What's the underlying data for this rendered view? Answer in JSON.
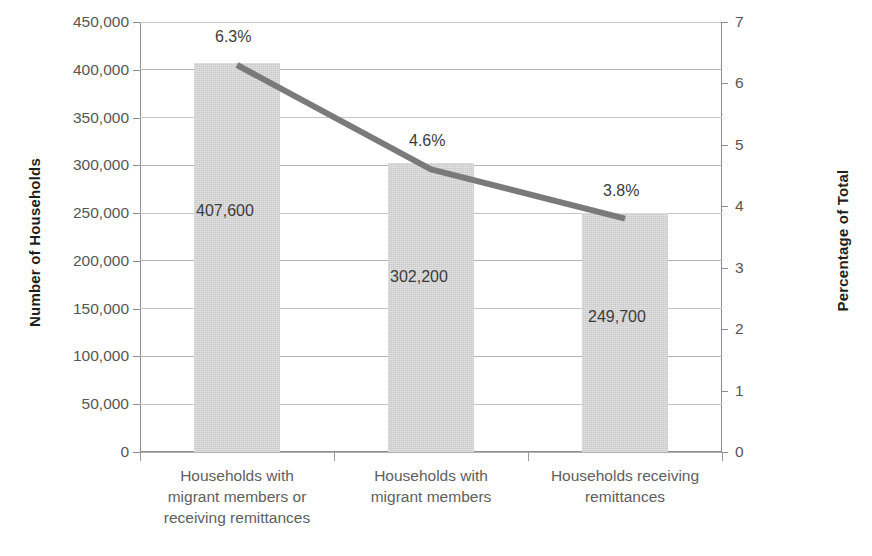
{
  "chart_data": {
    "type": "bar",
    "title": "",
    "subtitle": "",
    "categories": [
      "Households with migrant members or receiving remittances",
      "Households with migrant members",
      "Households receiving remittances"
    ],
    "category_lines": [
      [
        "Households with",
        "migrant members or",
        "receiving remittances"
      ],
      [
        "Households with",
        "migrant members"
      ],
      [
        "Households receiving",
        "remittances"
      ]
    ],
    "series": [
      {
        "name": "Number of Households",
        "type": "bar",
        "axis": "left",
        "values": [
          407600,
          302200,
          249700
        ],
        "value_labels": [
          "407,600",
          "302,200",
          "249,700"
        ],
        "color": "#c9c9c9"
      },
      {
        "name": "Percentage of Total",
        "type": "line",
        "axis": "right",
        "values": [
          6.3,
          4.6,
          3.8
        ],
        "value_labels": [
          "6.3%",
          "4.6%",
          "3.8%"
        ],
        "color": "#7a7a7a"
      }
    ],
    "xlabel": "",
    "ylabel": "Number of Households",
    "y2label": "Percentage of Total",
    "ylim": [
      0,
      450000
    ],
    "y2lim": [
      0,
      7
    ],
    "ytick_step": 50000,
    "y2tick_step": 1,
    "yticks": [
      0,
      50000,
      100000,
      150000,
      200000,
      250000,
      300000,
      350000,
      400000,
      450000
    ],
    "ytick_labels": [
      "0",
      "50,000",
      "100,000",
      "150,000",
      "200,000",
      "250,000",
      "300,000",
      "350,000",
      "400,000",
      "450,000"
    ],
    "y2ticks": [
      0,
      1,
      2,
      3,
      4,
      5,
      6,
      7
    ],
    "y2tick_labels": [
      "0",
      "1",
      "2",
      "3",
      "4",
      "5",
      "6",
      "7"
    ],
    "grid": true,
    "grid_axis": "y",
    "legend": false,
    "legend_position": "none",
    "background": "#ffffff",
    "gridline_color": "#b3b3b3",
    "axis_color": "#8d8d8d",
    "text_color": "#565656"
  }
}
